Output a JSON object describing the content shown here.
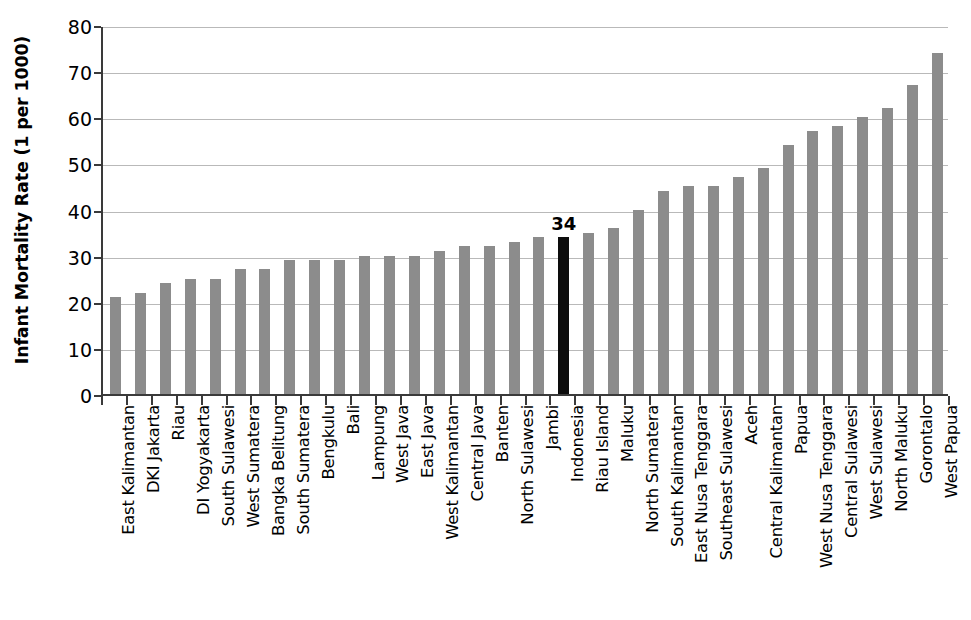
{
  "chart_data": {
    "type": "bar",
    "title": "",
    "xlabel": "",
    "ylabel": "Infant Mortality Rate (1 per 1000)",
    "ylim": [
      0,
      80
    ],
    "ytick_labels": [
      "0",
      "10",
      "20",
      "30",
      "40",
      "50",
      "60",
      "70",
      "80"
    ],
    "ytick_values": [
      0,
      10,
      20,
      30,
      40,
      50,
      60,
      70,
      80
    ],
    "grid": true,
    "legend": "none",
    "bar_color": "#8c8c8c",
    "highlight_color": "#0d0d0d",
    "highlight_category": "Indonesia",
    "annotations": [
      {
        "category": "Indonesia",
        "text": "34"
      }
    ],
    "categories": [
      "East Kalimantan",
      "DKI Jakarta",
      "Riau",
      "DI Yogyakarta",
      "South Sulawesi",
      "West Sumatera",
      "Bangka Belitung",
      "South Sumatera",
      "Bengkulu",
      "Bali",
      "Lampung",
      "West Java",
      "East Java",
      "West Kalimantan",
      "Central Java",
      "Banten",
      "North Sulawesi",
      "Jambi",
      "Indonesia",
      "Riau Island",
      "Maluku",
      "North Sumatera",
      "South Kalimantan",
      "East Nusa Tenggara",
      "Southeast Sulawesi",
      "Aceh",
      "Central Kalimantan",
      "Papua",
      "West Nusa Tenggara",
      "Central Sulawesi",
      "West Sulawesi",
      "North Maluku",
      "Gorontalo",
      "West Papua"
    ],
    "values": [
      21,
      22,
      24,
      25,
      25,
      27,
      27,
      29,
      29,
      29,
      30,
      30,
      30,
      31,
      32,
      32,
      33,
      34,
      34,
      35,
      36,
      40,
      44,
      45,
      45,
      47,
      49,
      54,
      57,
      58,
      60,
      62,
      67,
      74
    ]
  }
}
